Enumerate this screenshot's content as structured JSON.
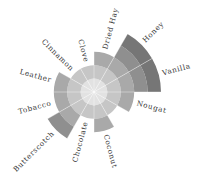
{
  "chart_data": {
    "type": "polar_area",
    "title": "",
    "start_angle_deg": 0,
    "direction": "clockwise",
    "rings_max": 5,
    "grid": false,
    "legend": null,
    "categories": [
      "Dried Hay",
      "Honey",
      "Vanilla",
      "Nougat",
      "",
      "Coconut",
      "Chocolate",
      "Butterscotch",
      "Tobacco",
      "Leather",
      "Cinnamon",
      "Clove"
    ],
    "values": [
      3,
      5,
      5,
      3,
      2,
      3,
      2,
      4,
      3,
      3,
      2,
      2
    ],
    "ring_colors": [
      "#e2e2e2",
      "#c6c6c6",
      "#a9a9a9",
      "#8f8f8f",
      "#767676"
    ],
    "separator_color": "#ffffff"
  }
}
